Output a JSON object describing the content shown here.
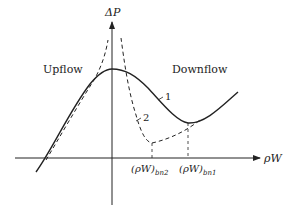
{
  "axes": {
    "y_label": "ΔP",
    "x_label": "ρW"
  },
  "regions": {
    "left": "Upflow",
    "right": "Downflow"
  },
  "curves": [
    {
      "id": "1",
      "label": "1",
      "style": "solid"
    },
    {
      "id": "2",
      "label": "2",
      "style": "dashed"
    }
  ],
  "ticks": {
    "bn2": {
      "main": "(ρW)",
      "sub": "bn2"
    },
    "bn1": {
      "main": "(ρW)",
      "sub": "bn1"
    }
  },
  "colors": {
    "ink": "#222222",
    "background": "#ffffff"
  }
}
